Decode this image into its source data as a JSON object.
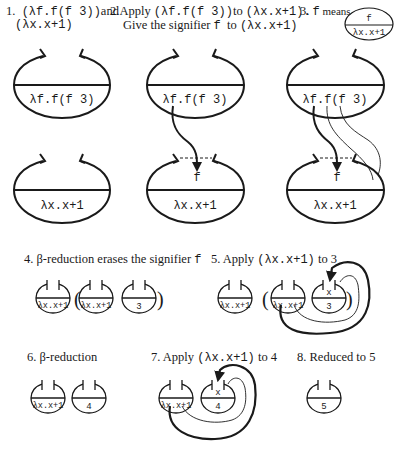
{
  "steps": [
    {
      "number": "1.",
      "parts": [
        {
          "t": "(λf.f(f 3))",
          "mono": true
        },
        {
          "t": "and",
          "mono": false
        }
      ],
      "line2": "(λx.x+1)"
    },
    {
      "number": "2.",
      "parts": [
        {
          "t": "Apply ",
          "mono": false
        },
        {
          "t": "(λf.f(f 3))",
          "mono": true
        },
        {
          "t": "to ",
          "mono": false
        },
        {
          "t": "(λx.x+1).",
          "mono": true
        }
      ],
      "line2_parts": [
        {
          "t": "Give the signifier ",
          "mono": false
        },
        {
          "t": "f",
          "mono": true
        },
        {
          "t": "  to ",
          "mono": false
        },
        {
          "t": "(λx.x+1)",
          "mono": true
        }
      ]
    },
    {
      "number": "3.",
      "parts": [
        {
          "t": "f",
          "mono": true
        },
        {
          "t": " means",
          "mono": false
        }
      ],
      "legend_top": "f",
      "legend_bottom": "λx.x+1"
    },
    {
      "number": "4.",
      "text": "β-reduction erases the signifier",
      "mono_suffix": "f"
    },
    {
      "number": "5.",
      "text": "Apply",
      "mono_mid": "(λx.x+1)",
      "suffix": "to 3"
    },
    {
      "number": "6.",
      "text": "β-reduction"
    },
    {
      "number": "7.",
      "text": "Apply",
      "mono_mid": "(λx.x+1)",
      "suffix": "to 4"
    },
    {
      "number": "8.",
      "text": "Reduced to 5"
    }
  ],
  "ovals": {
    "lambda_f": "λf.f(f 3)",
    "lambda_x": "λx.x+1",
    "signifier": "f",
    "var_x": "x",
    "three": "3",
    "four": "4",
    "five": "5"
  },
  "parens": {
    "open": "(",
    "close": ")"
  },
  "colors": {
    "ink": "#1a1a1a",
    "background": "#ffffff"
  }
}
